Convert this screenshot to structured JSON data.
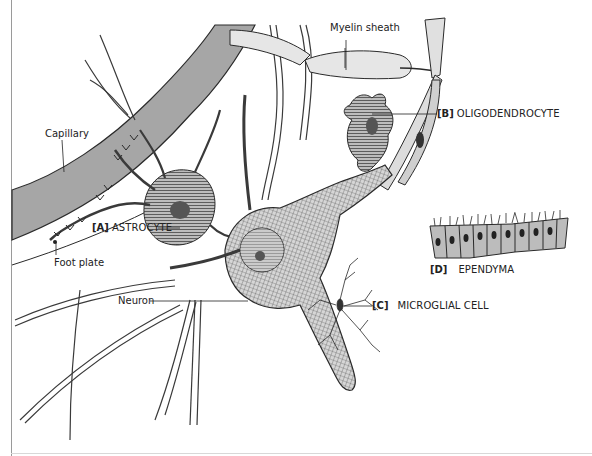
{
  "figure": {
    "caption_fragment": "[B]...(top line of caption cropped; text not legible)",
    "colors": {
      "capillary_fill": "#a6a6a6",
      "cell_fill": "#d4d4d4",
      "myelin_fill": "#e6e6e6",
      "ink": "#2a2a2a",
      "background": "#ffffff"
    }
  },
  "labels": {
    "myelin_sheath": "Myelin sheath",
    "capillary": "Capillary",
    "foot_plate": "Foot plate",
    "neuron": "Neuron",
    "astrocyte": {
      "code": "[A]",
      "name": "ASTROCYTE"
    },
    "oligodendrocyte": {
      "code": "[B]",
      "name": "OLIGODENDROCYTE"
    },
    "microglial": {
      "code": "[C]",
      "name": "MICROGLIAL CELL"
    },
    "ependyma": {
      "code": "[D]",
      "name": "EPENDYMA"
    }
  }
}
